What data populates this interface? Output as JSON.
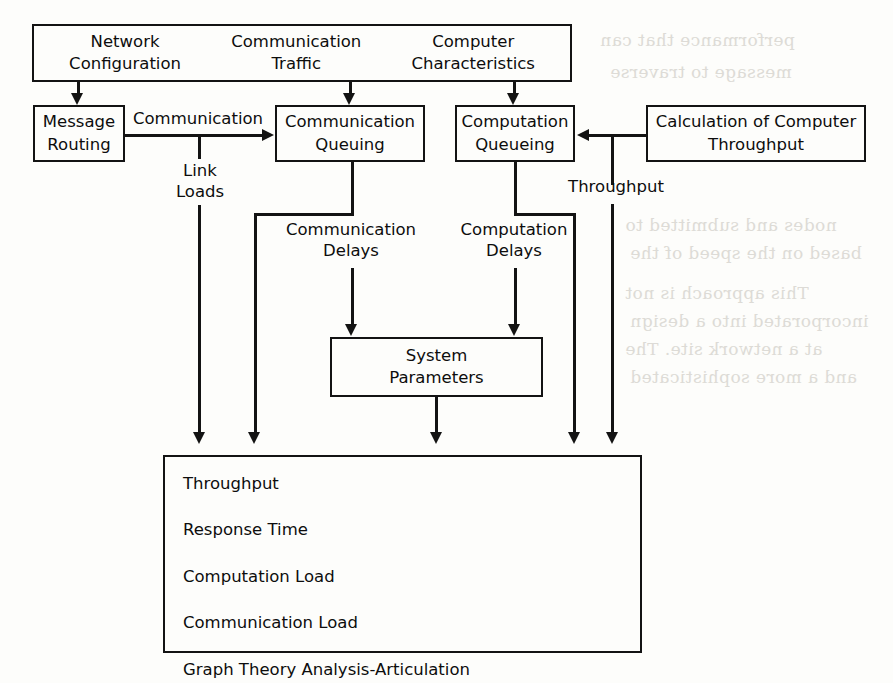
{
  "diagram": {
    "colors": {
      "line": "#131313",
      "text": "#0d0d0d",
      "background": "#fdfdfb"
    },
    "inputs_box": {
      "items": [
        "Network\nConfiguration",
        "Communication\nTraffic",
        "Computer\nCharacteristics"
      ]
    },
    "process_boxes": {
      "message_routing": "Message\nRouting",
      "communication_queuing": "Communication\nQueuing",
      "computation_queueing": "Computation\nQueueing",
      "calculation_of_computer_throughput": "Calculation of Computer\nThroughput",
      "system_parameters": "System\nParameters"
    },
    "edge_labels": {
      "communication": "Communication",
      "link_loads": "Link\nLoads",
      "communication_delays": "Communication\nDelays",
      "computation_delays": "Computation\nDelays",
      "throughput": "Throughput"
    },
    "outputs_box": {
      "items": [
        "Throughput",
        "Response Time",
        "Computation Load",
        "Communication Load",
        "Graph Theory Analysis-Articulation"
      ]
    },
    "bleed_through": [
      "performance that can",
      "message to traverse",
      "nodes and submitted to",
      "based on the speed of the",
      "This approach is not",
      "incorporated into a design",
      "at a network site. The",
      "and a more sophisticated"
    ]
  }
}
